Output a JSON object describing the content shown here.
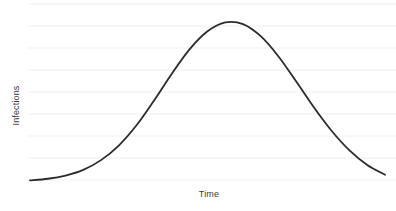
{
  "chart_data": {
    "type": "line",
    "title": "",
    "subtitle": "",
    "xlabel": "Time",
    "ylabel": "Infections",
    "legend": [],
    "annotations": [],
    "grid": {
      "horizontal": true,
      "vertical": false,
      "color": "#f6f6f8",
      "count": 8,
      "spacing_px": 22
    },
    "axes": {
      "x_ticks": [],
      "y_ticks": [],
      "x_tick_labels": [],
      "y_tick_labels": [],
      "xlim": [
        0,
        1
      ],
      "ylim": [
        0,
        1
      ],
      "show_spines": false
    },
    "series": [
      {
        "name": "Infections",
        "color": "#2b2b2b",
        "line_width": 1.8,
        "shape": "gaussian",
        "peak_x": 0.5,
        "peak_y": 1.0,
        "x": [
          0.0,
          0.05,
          0.1,
          0.15,
          0.2,
          0.25,
          0.3,
          0.35,
          0.4,
          0.45,
          0.5,
          0.55,
          0.6,
          0.65,
          0.7,
          0.75,
          0.8,
          0.85,
          0.9,
          0.95,
          1.0
        ],
        "values": [
          0.01,
          0.02,
          0.04,
          0.075,
          0.135,
          0.225,
          0.35,
          0.505,
          0.67,
          0.82,
          0.93,
          0.985,
          0.975,
          0.9,
          0.775,
          0.62,
          0.46,
          0.315,
          0.195,
          0.105,
          0.045
        ]
      }
    ]
  },
  "chart": {
    "y_axis_label": "Infections",
    "x_axis_label": "Time"
  }
}
